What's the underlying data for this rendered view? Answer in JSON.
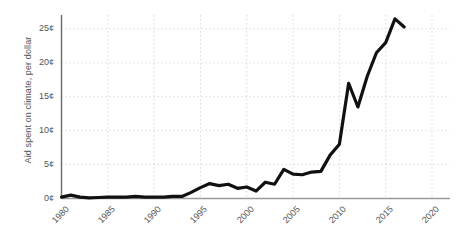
{
  "chart_data": {
    "type": "line",
    "title": "",
    "subtitle": "",
    "xlabel": "",
    "ylabel": "Aid spent on climate, per dollar",
    "xlim": [
      1980,
      2020
    ],
    "ylim": [
      0,
      27
    ],
    "grid": true,
    "legend": false,
    "legend_position": "none",
    "line_color": "#111111",
    "line_width": 3.2,
    "y_tick_labels": [
      "0¢",
      "5¢",
      "10¢",
      "15¢",
      "20¢",
      "25¢"
    ],
    "y_tick_values": [
      0,
      5,
      10,
      15,
      20,
      25
    ],
    "x_tick_labels": [
      "1980",
      "1985",
      "1990",
      "1995",
      "2000",
      "2005",
      "2010",
      "2015",
      "2020"
    ],
    "x_tick_values": [
      1980,
      1985,
      1990,
      1995,
      2000,
      2005,
      2010,
      2015,
      2020
    ],
    "unit": "cents per dollar",
    "series": [
      {
        "name": "Aid spent on climate, per dollar",
        "x": [
          1980,
          1981,
          1982,
          1983,
          1984,
          1985,
          1986,
          1987,
          1988,
          1989,
          1990,
          1991,
          1992,
          1993,
          1994,
          1995,
          1996,
          1997,
          1998,
          1999,
          2000,
          2001,
          2002,
          2003,
          2004,
          2005,
          2006,
          2007,
          2008,
          2009,
          2010,
          2011,
          2012,
          2013,
          2014,
          2015,
          2016,
          2017
        ],
        "values": [
          0.2,
          0.5,
          0.2,
          0.1,
          0.15,
          0.2,
          0.2,
          0.2,
          0.3,
          0.2,
          0.2,
          0.2,
          0.3,
          0.3,
          0.9,
          1.6,
          2.2,
          1.9,
          2.1,
          1.5,
          1.7,
          1.1,
          2.4,
          2.1,
          4.3,
          3.6,
          3.5,
          3.9,
          4.0,
          6.4,
          8.0,
          17.0,
          13.5,
          18.0,
          21.5,
          23.0,
          26.5,
          25.3
        ]
      }
    ],
    "annotations": []
  }
}
